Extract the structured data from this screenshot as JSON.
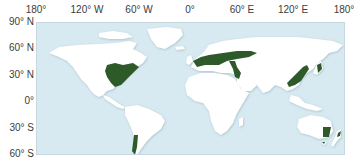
{
  "map": {
    "projection": "equirectangular world map",
    "colors": {
      "ocean": "#d7e9f1",
      "land": "#ffffff",
      "highlight": "#2d5a28",
      "frame": "#c8d8df"
    },
    "longitude_labels": [
      "180°",
      "120° W",
      "60° W",
      "0°",
      "60° E",
      "120° E",
      "180°"
    ],
    "latitude_labels": [
      "90° N",
      "60° N",
      "30° N",
      "0°",
      "30° S",
      "60° S"
    ],
    "highlighted_regions": [
      "Eastern North America",
      "Europe",
      "Eastern Asia (China, Korea, Japan)",
      "Southern Chile",
      "Southeastern Australia",
      "New Zealand"
    ]
  }
}
